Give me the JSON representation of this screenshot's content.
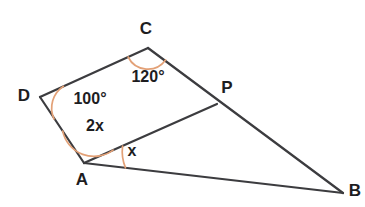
{
  "figure": {
    "background_color": "#ffffff",
    "line_color": "#3c3c3f",
    "arc_color": "#e3a177",
    "label_color": "#1d1d1f"
  },
  "vertices": [
    {
      "name": "C",
      "label": "C",
      "x": 148,
      "y": 48,
      "label_x": 146,
      "label_y": 30
    },
    {
      "name": "D",
      "label": "D",
      "x": 40,
      "y": 97,
      "label_x": 24,
      "label_y": 97
    },
    {
      "name": "P",
      "label": "P",
      "x": 217,
      "y": 104,
      "label_x": 227,
      "label_y": 89
    },
    {
      "name": "A",
      "label": "A",
      "x": 84,
      "y": 163,
      "label_x": 82,
      "label_y": 181
    },
    {
      "name": "B",
      "label": "B",
      "x": 343,
      "y": 193,
      "label_x": 355,
      "label_y": 192
    }
  ],
  "segments": [
    {
      "name": "segment-D-C",
      "from": "D",
      "to": "C"
    },
    {
      "name": "segment-C-P-B",
      "from": "C",
      "to": "B",
      "note": "passes through P"
    },
    {
      "name": "segment-D-A",
      "from": "D",
      "to": "A"
    },
    {
      "name": "segment-A-P",
      "from": "A",
      "to": "P"
    },
    {
      "name": "segment-A-B",
      "from": "A",
      "to": "B"
    }
  ],
  "angles": [
    {
      "name": "angle-at-C",
      "vertex": "C",
      "label": "120°",
      "value": 120,
      "unit": "degrees",
      "label_x": 148,
      "label_y": 78
    },
    {
      "name": "angle-at-D",
      "vertex": "D",
      "label": "100°",
      "value": 100,
      "unit": "degrees",
      "label_x": 90,
      "label_y": 100
    },
    {
      "name": "angle-DAP",
      "vertex": "A",
      "label": "2x",
      "value": "2x",
      "unit": "expression",
      "label_x": 95,
      "label_y": 127
    },
    {
      "name": "angle-PAB",
      "vertex": "A",
      "label": "x",
      "value": "x",
      "unit": "expression",
      "label_x": 132,
      "label_y": 152
    }
  ]
}
